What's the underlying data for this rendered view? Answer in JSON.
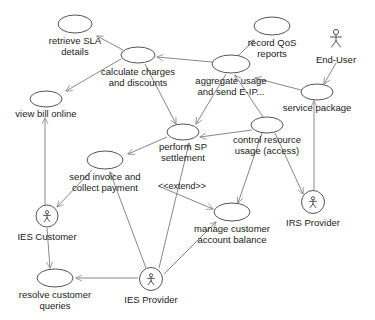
{
  "diagram": {
    "type": "uml-use-case-diagram",
    "width": 375,
    "height": 320,
    "background": "#ffffff",
    "stroke_color": "#555555",
    "edge_color": "#888888",
    "text_color": "#1a1a1a",
    "use_cases": [
      {
        "id": "retrieve_sla",
        "line1": "retrieve SLA",
        "line2": "details",
        "cx": 75,
        "cy": 24,
        "rx": 17,
        "ry": 9,
        "tx": 75,
        "ty": 41
      },
      {
        "id": "record_qos",
        "line1": "record QoS",
        "line2": "reports",
        "cx": 272,
        "cy": 26,
        "rx": 18,
        "ry": 9,
        "tx": 272,
        "ty": 43
      },
      {
        "id": "calculate_charges",
        "line1": "calculate charges",
        "line2": "and discounts",
        "cx": 138,
        "cy": 55,
        "rx": 17,
        "ry": 8,
        "tx": 138,
        "ty": 72
      },
      {
        "id": "aggregate_usage",
        "line1": "aggregate usage",
        "line2": "and send E-IP...",
        "cx": 231,
        "cy": 64,
        "rx": 19,
        "ry": 9,
        "tx": 231,
        "ty": 81
      },
      {
        "id": "view_bill_online",
        "line1": "view bill online",
        "line2": "",
        "cx": 46,
        "cy": 99,
        "rx": 16,
        "ry": 8,
        "tx": 46,
        "ty": 114
      },
      {
        "id": "service_package",
        "line1": "service package",
        "line2": "",
        "cx": 317,
        "cy": 92,
        "rx": 16,
        "ry": 8,
        "tx": 317,
        "ty": 108
      },
      {
        "id": "perform_sp",
        "line1": "perform SP",
        "line2": "settlement",
        "cx": 183,
        "cy": 132,
        "rx": 16,
        "ry": 8,
        "tx": 183,
        "ty": 147
      },
      {
        "id": "control_resource",
        "line1": "control resource",
        "line2": "usage (access)",
        "cx": 267,
        "cy": 125,
        "rx": 16,
        "ry": 8,
        "tx": 267,
        "ty": 140
      },
      {
        "id": "send_invoice",
        "line1": "send invoice and",
        "line2": "collect payment",
        "cx": 105,
        "cy": 160,
        "rx": 18,
        "ry": 9,
        "tx": 105,
        "ty": 177
      },
      {
        "id": "manage_customer",
        "line1": "manage customer",
        "line2": "account balance",
        "cx": 232,
        "cy": 212,
        "rx": 18,
        "ry": 9,
        "tx": 232,
        "ty": 229
      },
      {
        "id": "resolve_queries",
        "line1": "resolve customer",
        "line2": "queries",
        "cx": 55,
        "cy": 278,
        "rx": 18,
        "ry": 9,
        "tx": 55,
        "ty": 295
      }
    ],
    "actors": [
      {
        "id": "end_user",
        "label": "End-User",
        "cx": 336,
        "cy": 38,
        "r": 0,
        "tx": 336,
        "ty": 60,
        "boxed": false
      },
      {
        "id": "ies_customer",
        "label": "IES Customer",
        "cx": 47,
        "cy": 216,
        "r": 11,
        "tx": 47,
        "ty": 237,
        "boxed": true
      },
      {
        "id": "irs_provider",
        "label": "IRS Provider",
        "cx": 313,
        "cy": 202,
        "r": 11.5,
        "tx": 313,
        "ty": 223,
        "boxed": true
      },
      {
        "id": "ies_provider",
        "label": "IES Provider",
        "cx": 151,
        "cy": 279,
        "r": 11.5,
        "tx": 151,
        "ty": 300,
        "boxed": true
      }
    ],
    "edge_labels": [
      {
        "id": "extend_stereotype",
        "text": "<<extend>>",
        "tx": 182,
        "ty": 187
      }
    ],
    "edges": [
      {
        "id": "calculate-to-retrieve",
        "from": "calculate_charges",
        "to": "retrieve_sla",
        "path": "M 123,50 L 97,36"
      },
      {
        "id": "calculate-to-viewbill",
        "from": "calculate_charges",
        "to": "view_bill_online",
        "path": "M 121,59 L 66,91"
      },
      {
        "id": "aggregate-to-recordqos",
        "from": "aggregate_usage",
        "to": "record_qos",
        "path": "M 238,56 L 254,40"
      },
      {
        "id": "aggregate-to-calculate",
        "from": "aggregate_usage",
        "to": "calculate_charges",
        "path": "M 212,62 L 157,57"
      },
      {
        "id": "servicepkg-to-aggregate",
        "from": "service_package",
        "to": "aggregate_usage",
        "path": "M 301,90 L 255,78"
      },
      {
        "id": "enduser-to-servicepkg",
        "from": "end_user",
        "to": "service_package",
        "path": "M 336,63 L 324,84"
      },
      {
        "id": "calculate-to-performsp",
        "from": "calculate_charges",
        "to": "perform_sp",
        "path": "M 145,64 L 176,124"
      },
      {
        "id": "aggregate-to-performsp",
        "from": "aggregate_usage",
        "to": "perform_sp",
        "path": "M 226,74 L 196,124"
      },
      {
        "id": "performsp-to-sendinvoice",
        "from": "perform_sp",
        "to": "send_invoice",
        "path": "M 167,137 L 128,154"
      },
      {
        "id": "control-to-performsp",
        "from": "control_resource",
        "to": "perform_sp",
        "path": "M 252,130 L 200,137"
      },
      {
        "id": "control-to-aggregate",
        "from": "control_resource",
        "to": "aggregate_usage",
        "path": "M 263,117 L 235,75"
      },
      {
        "id": "control-to-irsprovider",
        "from": "control_resource",
        "to": "irs_provider",
        "path": "M 275,133 L 303,194"
      },
      {
        "id": "control-to-manage",
        "from": "control_resource",
        "to": "manage_customer",
        "path": "M 262,133 L 238,203"
      },
      {
        "id": "servicepkg-to-irsprovider",
        "from": "service_package",
        "to": "irs_provider",
        "path": "M 314,190 L 314,101"
      },
      {
        "id": "sendinvoice-to-iescustomer",
        "from": "send_invoice",
        "to": "ies_customer",
        "path": "M 92,170 L 57,207"
      },
      {
        "id": "viewbill-to-iescustomer",
        "from": "view_bill_online",
        "to": "ies_customer",
        "path": "M 45,207 L 45,118"
      },
      {
        "id": "extend-to-manage",
        "from": "send_invoice",
        "to": "manage_customer",
        "path": "M 163,188 L 213,209"
      },
      {
        "id": "iesprovider-to-sendinvoice",
        "from": "ies_provider",
        "to": "send_invoice",
        "path": "M 146,268 L 110,172"
      },
      {
        "id": "iesprovider-to-performsp",
        "from": "ies_provider",
        "to": "perform_sp",
        "path": "M 159,268 L 189,143"
      },
      {
        "id": "iesprovider-to-manage",
        "from": "ies_provider",
        "to": "manage_customer",
        "path": "M 164,274 L 216,222"
      },
      {
        "id": "iesprovider-to-resolve",
        "from": "ies_provider",
        "to": "resolve_queries",
        "path": "M 138,278 L 76,278"
      },
      {
        "id": "iescustomer-to-resolve",
        "from": "ies_customer",
        "to": "resolve_queries",
        "path": "M 47,228 L 50,268"
      }
    ]
  }
}
